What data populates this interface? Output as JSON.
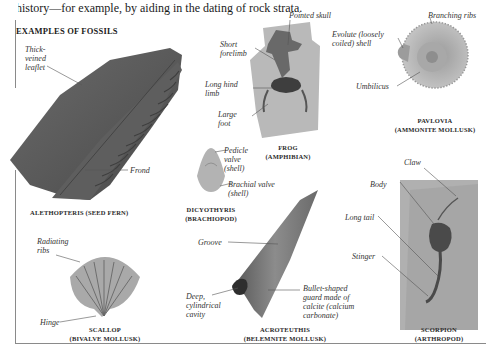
{
  "intro_text": "history—for example, by aiding in the dating of rock strata.",
  "section_title": "EXAMPLES OF FOSSILS",
  "fossils": [
    {
      "id": "alethopteris",
      "caption_line1": "ALETHOPTERIS (SEED FERN)",
      "caption_line2": "",
      "labels": [
        "Thick-\nveined\nleaflet",
        "Frond"
      ]
    },
    {
      "id": "frog",
      "caption_line1": "FROG",
      "caption_line2": "(AMPHIBIAN)",
      "labels": [
        "Pointed skull",
        "Short\nforelimb",
        "Long hind\nlimb",
        "Large\nfoot"
      ]
    },
    {
      "id": "pavlovia",
      "caption_line1": "PAVLOVIA",
      "caption_line2": "(AMMONITE MOLLUSK)",
      "labels": [
        "Branching ribs",
        "Evolute (loosely\ncoiled) shell",
        "Umbilicus"
      ]
    },
    {
      "id": "dicyothyris",
      "caption_line1": "DICYOTHYRIS",
      "caption_line2": "(BRACHIOPOD)",
      "labels": [
        "Pedicle\nvalve\n(shell)",
        "Brachial valve\n(shell)"
      ]
    },
    {
      "id": "scallop",
      "caption_line1": "SCALLOP",
      "caption_line2": "(BIVALVE MOLLUSK)",
      "labels": [
        "Radiating\nribs",
        "Hinge"
      ]
    },
    {
      "id": "acroteuthis",
      "caption_line1": "ACROTEUTHIS",
      "caption_line2": "(BELEMNITE MOLLUSK)",
      "labels": [
        "Groove",
        "Deep,\ncylindrical\ncavity",
        "Bullet-shaped\nguard made of\ncalcite (calcium\ncarbonate)"
      ]
    },
    {
      "id": "scorpion",
      "caption_line1": "SCORPION",
      "caption_line2": "(ARTHROPOD)",
      "labels": [
        "Claw",
        "Body",
        "Long tail",
        "Stinger"
      ]
    }
  ]
}
